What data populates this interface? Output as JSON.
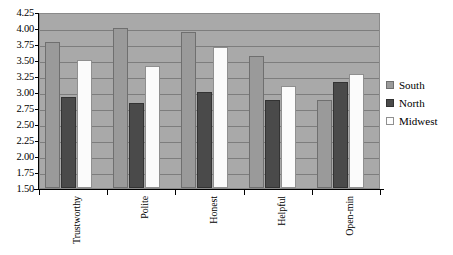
{
  "chart_data": {
    "type": "bar",
    "title": "",
    "xlabel": "",
    "ylabel": "",
    "ylim": [
      1.5,
      4.25
    ],
    "ytick_step": 0.25,
    "grid": true,
    "legend_position": "right",
    "categories": [
      "Trustworthy",
      "Polite",
      "Honest",
      "Helpful",
      "Open-min"
    ],
    "ytick_labels": [
      "4.25",
      "4.00",
      "3.75",
      "3.50",
      "3.25",
      "3.00",
      "2.75",
      "2.50",
      "2.25",
      "2.00",
      "1.75",
      "1.50"
    ],
    "ytick_values": [
      4.25,
      4.0,
      3.75,
      3.5,
      3.25,
      3.0,
      2.75,
      2.5,
      2.25,
      2.0,
      1.75,
      1.5
    ],
    "series": [
      {
        "name": "South",
        "color": "#9a9a9a",
        "values": [
          3.78,
          4.0,
          3.93,
          3.56,
          2.88
        ]
      },
      {
        "name": "North",
        "color": "#4a4a4a",
        "values": [
          2.92,
          2.83,
          3.0,
          2.87,
          3.16
        ]
      },
      {
        "name": "Midwest",
        "color": "#fbfbfb",
        "values": [
          3.5,
          3.41,
          3.7,
          3.1,
          3.28
        ]
      }
    ]
  },
  "legend": {
    "items": [
      {
        "label": "South",
        "swatch": "south-swatch-icon"
      },
      {
        "label": "North",
        "swatch": "north-swatch-icon"
      },
      {
        "label": "Midwest",
        "swatch": "midwest-swatch-icon"
      }
    ]
  },
  "colors": {
    "plot_background": "#a9a9a9",
    "gridline": "#7d7d7d",
    "south": "#9a9a9a",
    "north": "#4a4a4a",
    "midwest": "#fbfbfb",
    "axis": "#000000",
    "page_background": "#ffffff"
  }
}
